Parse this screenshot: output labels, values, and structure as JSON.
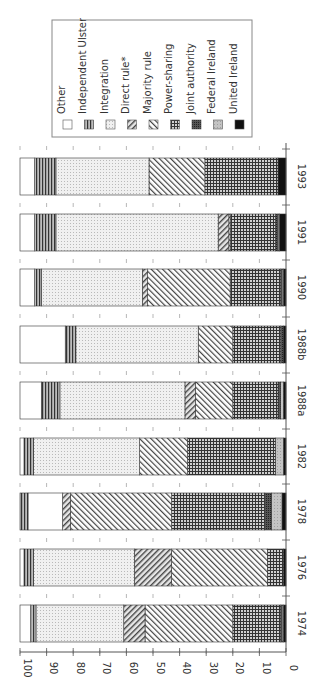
{
  "chart_data": {
    "type": "bar",
    "orientation": "stacked, 100% scale, figure rotated 90° clockwise",
    "title": "",
    "xlabel": "",
    "ylabel": "",
    "ylim": [
      0,
      100
    ],
    "yticks": [
      "0",
      "10",
      "20",
      "30",
      "40",
      "50",
      "60",
      "70",
      "80",
      "90",
      "100"
    ],
    "categories": [
      "1974",
      "1976",
      "1978",
      "1982",
      "1988a",
      "1988b",
      "1990",
      "1991",
      "1993"
    ],
    "legend_position": "top (upper-right in rotated figure)",
    "grid": "dotted tick marks between bars",
    "series": [
      {
        "name": "United Ireland",
        "pattern": "solid-black",
        "values": [
          1,
          1,
          1.5,
          1,
          1,
          1,
          1,
          2.5,
          3
        ]
      },
      {
        "name": "Federal Ireland",
        "pattern": "light-gray",
        "values": [
          0.5,
          0,
          4,
          3,
          1,
          0,
          0.5,
          0.5,
          0
        ]
      },
      {
        "name": "Joint authority",
        "pattern": "dark-crosshatch",
        "values": [
          0.5,
          0,
          2.5,
          0,
          1,
          1,
          0.5,
          1,
          0
        ]
      },
      {
        "name": "Power-sharing",
        "pattern": "grid",
        "values": [
          18,
          6,
          35,
          33,
          17,
          18,
          19,
          17,
          27.5
        ]
      },
      {
        "name": "Majority rule",
        "pattern": "diagonal-hatch-back",
        "values": [
          33,
          36,
          38,
          18,
          14,
          13,
          31,
          0.5,
          21
        ]
      },
      {
        "name": "Direct rule*",
        "pattern": "diagonal-hatch-forward",
        "values": [
          8,
          14,
          3,
          0,
          4,
          0,
          2,
          4,
          0
        ]
      },
      {
        "name": "Integration",
        "pattern": "fine-dots",
        "values": [
          33,
          38,
          0,
          40,
          47,
          46,
          38,
          61,
          35
        ]
      },
      {
        "name": "Independent Ulster",
        "pattern": "horizontal-lines",
        "values": [
          2,
          3.5,
          3,
          3.5,
          7,
          4,
          2.5,
          8,
          8
        ]
      },
      {
        "name": "Other",
        "pattern": "white",
        "values": [
          4,
          1.5,
          13,
          1.5,
          8,
          17,
          5.5,
          5.5,
          5.5
        ]
      }
    ]
  },
  "legend": {
    "items": [
      {
        "label": "Other",
        "key": "other"
      },
      {
        "label": "Independent Ulster",
        "key": "indulster"
      },
      {
        "label": "Integration",
        "key": "integration"
      },
      {
        "label": "Direct rule*",
        "key": "direct"
      },
      {
        "label": "Majority rule",
        "key": "majority"
      },
      {
        "label": "Power-sharing",
        "key": "power"
      },
      {
        "label": "Joint authority",
        "key": "joint"
      },
      {
        "label": "Federal Ireland",
        "key": "federal"
      },
      {
        "label": "United Ireland",
        "key": "united"
      }
    ]
  },
  "stack_order": {
    "default": [
      "United Ireland",
      "Federal Ireland",
      "Joint authority",
      "Power-sharing",
      "Majority rule",
      "Direct rule*",
      "Integration",
      "Independent Ulster",
      "Other"
    ],
    "1978": [
      "United Ireland",
      "Federal Ireland",
      "Joint authority",
      "Power-sharing",
      "Majority rule",
      "Direct rule*",
      "Integration",
      "Other",
      "Independent Ulster"
    ]
  }
}
